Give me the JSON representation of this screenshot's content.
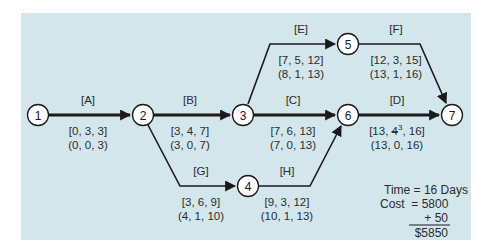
{
  "diagram": {
    "type": "pert-network",
    "colors": {
      "panel": "#d3e6ec",
      "line": "#1a1a1a",
      "node_fill": "#ffffff",
      "text": "#2b2b2b"
    },
    "nodes": [
      {
        "id": "1",
        "label": "1"
      },
      {
        "id": "2",
        "label": "2"
      },
      {
        "id": "3",
        "label": "3"
      },
      {
        "id": "4",
        "label": "4"
      },
      {
        "id": "5",
        "label": "5"
      },
      {
        "id": "6",
        "label": "6"
      },
      {
        "id": "7",
        "label": "7"
      }
    ],
    "activities": [
      {
        "name": "[A]",
        "from": "1",
        "to": "2",
        "critical": true,
        "times": "[0, 3, 3]",
        "slack": "(0, 0, 3)"
      },
      {
        "name": "[B]",
        "from": "2",
        "to": "3",
        "critical": true,
        "times": "[3, 4, 7]",
        "slack": "(3, 0, 7)"
      },
      {
        "name": "[C]",
        "from": "3",
        "to": "6",
        "critical": true,
        "times": "[7, 6, 13]",
        "slack": "(7, 0, 13)"
      },
      {
        "name": "[D]",
        "from": "6",
        "to": "7",
        "critical": true,
        "times_prefix": "[13, ",
        "times_struck": "4",
        "times_sup": "3",
        "times_suffix": ", 16]",
        "slack": "(13, 0, 16)"
      },
      {
        "name": "[E]",
        "from": "3",
        "to": "5",
        "critical": false,
        "times": "[7, 5, 12]",
        "slack": "(8, 1, 13)"
      },
      {
        "name": "[F]",
        "from": "5",
        "to": "7",
        "critical": false,
        "times": "[12, 3, 15]",
        "slack": "(13, 1, 16)"
      },
      {
        "name": "[G]",
        "from": "2",
        "to": "4",
        "critical": false,
        "times": "[3, 6, 9]",
        "slack": "(4, 1, 10)"
      },
      {
        "name": "[H]",
        "from": "4",
        "to": "6",
        "critical": false,
        "times": "[9, 3, 12]",
        "slack": "(10, 1, 13)"
      }
    ],
    "summary": {
      "time_line": "Time = 16 Days",
      "cost_line": "Cost  = 5800",
      "add_line": "+ 50",
      "total_line": "$5850"
    }
  }
}
